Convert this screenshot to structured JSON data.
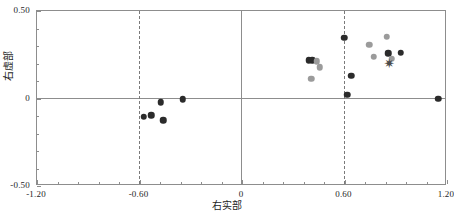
{
  "chart_data": {
    "type": "scatter",
    "title": "",
    "xlabel": "右实部",
    "ylabel": "右虚部",
    "xlim": [
      -1.2,
      1.2
    ],
    "ylim": [
      -0.5,
      0.5
    ],
    "xticks": [
      "-1.20",
      "-0.60",
      "0",
      "0.60",
      "1.20"
    ],
    "xtick_values": [
      -1.2,
      -0.6,
      0,
      0.6,
      1.2
    ],
    "yticks": [
      "0.50",
      "0",
      "-0.50"
    ],
    "ytick_values": [
      0.5,
      0,
      -0.5
    ],
    "grid": false,
    "legend": "none",
    "reference_lines": {
      "solid_horizontal": [
        0
      ],
      "solid_vertical": [
        0
      ],
      "dashed_vertical": [
        -0.6,
        0.6
      ]
    },
    "colors": {
      "dark_marker": "#2b2b2b",
      "gray_marker": "#9b9b9b",
      "mid_marker": "#5f5f5f",
      "light_marker": "#c4c4c4",
      "axis": "#8d8d8d",
      "text": "#1e1e1e",
      "background": "#ffffff"
    },
    "series": [
      {
        "name": "dark",
        "color": "#2b2b2b",
        "marker": "circle",
        "points": [
          {
            "x": -0.575,
            "y": -0.105
          },
          {
            "x": -0.53,
            "y": -0.095
          },
          {
            "x": -0.475,
            "y": -0.02
          },
          {
            "x": -0.462,
            "y": -0.123
          },
          {
            "x": -0.348,
            "y": -0.003
          },
          {
            "x": 0.392,
            "y": 0.218
          },
          {
            "x": 0.412,
            "y": 0.22
          },
          {
            "x": 0.598,
            "y": 0.348
          },
          {
            "x": 0.615,
            "y": 0.022
          },
          {
            "x": 0.64,
            "y": 0.13
          },
          {
            "x": 0.856,
            "y": 0.258
          },
          {
            "x": 0.93,
            "y": 0.262
          },
          {
            "x": 1.148,
            "y": -0.002
          }
        ]
      },
      {
        "name": "gray",
        "color": "#9b9b9b",
        "marker": "circle",
        "points": [
          {
            "x": 0.438,
            "y": 0.212
          },
          {
            "x": 0.455,
            "y": 0.178
          },
          {
            "x": 0.405,
            "y": 0.112
          },
          {
            "x": 0.745,
            "y": 0.308
          },
          {
            "x": 0.77,
            "y": 0.238
          },
          {
            "x": 0.848,
            "y": 0.352
          },
          {
            "x": 0.878,
            "y": 0.228
          }
        ]
      },
      {
        "name": "star-overlap",
        "color": "#4a4a4a",
        "marker": "star",
        "points": [
          {
            "x": 0.862,
            "y": 0.205
          }
        ]
      }
    ]
  }
}
